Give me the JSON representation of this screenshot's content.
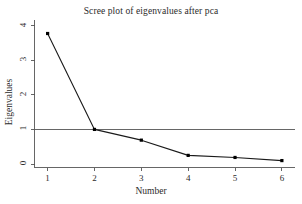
{
  "chart_data": {
    "type": "line",
    "title": "Scree plot of eigenvalues after pca",
    "xlabel": "Number",
    "ylabel": "Eigenvalues",
    "x": [
      1,
      2,
      3,
      4,
      5,
      6
    ],
    "values": [
      3.77,
      1.0,
      0.69,
      0.25,
      0.19,
      0.1
    ],
    "series": [
      {
        "name": "Eigenvalues",
        "values": [
          3.77,
          1.0,
          0.69,
          0.25,
          0.19,
          0.1
        ]
      }
    ],
    "xtick_labels": [
      "1",
      "2",
      "3",
      "4",
      "5",
      "6"
    ],
    "ytick_labels": [
      "0",
      "1",
      "2",
      "3",
      "4"
    ],
    "ytick_values": [
      0,
      1,
      2,
      3,
      4
    ],
    "xlim": [
      0.72,
      6.28
    ],
    "ylim": [
      -0.1,
      4.16
    ],
    "grid": false,
    "legend": "none",
    "reference_line": {
      "axis": "y",
      "value": 1,
      "label": "1"
    },
    "marker": "filled-square",
    "line_color": "#1a1a1a",
    "marker_color": "#000000",
    "reference_line_color": "#555555",
    "axis_color": "#555555",
    "background_color": "#ffffff"
  }
}
